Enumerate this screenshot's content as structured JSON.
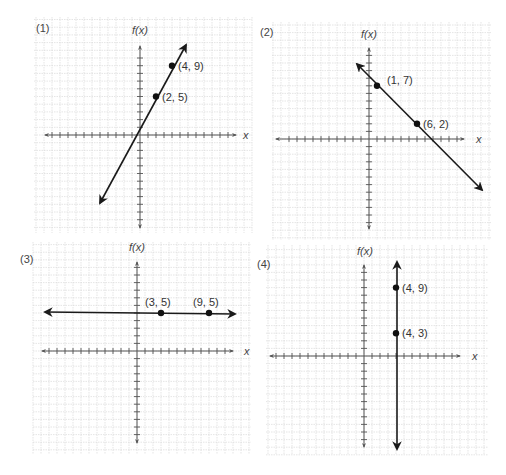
{
  "chart_data": [
    {
      "type": "line",
      "panel_label": "(1)",
      "ylabel": "f(x)",
      "xlabel": "x",
      "grid": true,
      "frame": {
        "x": 34,
        "y": 17,
        "w": 218,
        "h": 216
      },
      "origin": {
        "px": 140,
        "py": 135
      },
      "unit": {
        "x": 8,
        "y": 7.7
      },
      "xaxis": {
        "from": 45,
        "to": 236,
        "label_x": 243
      },
      "yaxis": {
        "from": 46,
        "to": 228,
        "label_y": 34
      },
      "label_pos": {
        "x": 36,
        "y": 32
      },
      "ylabel_pos": {
        "x": 132,
        "y": 34
      },
      "line": {
        "x1": 100,
        "y1": 203,
        "x2": 186,
        "y2": 45,
        "arrows": "both"
      },
      "points": [
        {
          "x": 2,
          "y": 5,
          "label": "(2, 5)"
        },
        {
          "x": 4,
          "y": 9,
          "label": "(4, 9)"
        }
      ],
      "description": "Increasing line through (2, 5) and (4, 9); slope 2"
    },
    {
      "type": "line",
      "panel_label": "(2)",
      "ylabel": "f(x)",
      "xlabel": "x",
      "grid": true,
      "frame": {
        "x": 272,
        "y": 22,
        "w": 220,
        "h": 218
      },
      "origin": {
        "px": 369,
        "py": 139
      },
      "unit": {
        "x": 8,
        "y": 7.6
      },
      "xaxis": {
        "from": 276,
        "to": 464,
        "label_x": 476
      },
      "yaxis": {
        "from": 48,
        "to": 229,
        "label_y": 38
      },
      "label_pos": {
        "x": 260,
        "y": 36
      },
      "ylabel_pos": {
        "x": 361,
        "y": 38
      },
      "line": {
        "x1": 357,
        "y1": 64,
        "x2": 482,
        "y2": 190,
        "arrows": "both"
      },
      "points": [
        {
          "x": 1,
          "y": 7,
          "label": "(1, 7)"
        },
        {
          "x": 6,
          "y": 2,
          "label": "(6, 2)"
        }
      ],
      "description": "Decreasing line through (1, 7) and (6, 2); slope -1"
    },
    {
      "type": "line",
      "panel_label": "(3)",
      "ylabel": "f(x)",
      "xlabel": "x",
      "grid": true,
      "frame": {
        "x": 33,
        "y": 242,
        "w": 218,
        "h": 212
      },
      "origin": {
        "px": 137,
        "py": 351
      },
      "unit": {
        "x": 8,
        "y": 7.6
      },
      "xaxis": {
        "from": 42,
        "to": 233,
        "label_x": 244
      },
      "yaxis": {
        "from": 262,
        "to": 443,
        "label_y": 251
      },
      "label_pos": {
        "x": 20,
        "y": 263
      },
      "ylabel_pos": {
        "x": 129,
        "y": 251
      },
      "line": {
        "x1": 45,
        "y1": 312,
        "x2": 235,
        "y2": 314,
        "arrows": "both"
      },
      "points": [
        {
          "x": 3,
          "y": 5,
          "label": "(3, 5)"
        },
        {
          "x": 9,
          "y": 5,
          "label": "(9, 5)"
        }
      ],
      "description": "Horizontal line f(x) = 5 through (3, 5) and (9, 5)"
    },
    {
      "type": "line",
      "panel_label": "(4)",
      "ylabel": "f(x)",
      "xlabel": "x",
      "grid": true,
      "frame": {
        "x": 266,
        "y": 245,
        "w": 222,
        "h": 210
      },
      "origin": {
        "px": 364,
        "py": 356
      },
      "unit": {
        "x": 8,
        "y": 7.6
      },
      "xaxis": {
        "from": 270,
        "to": 460,
        "label_x": 472
      },
      "yaxis": {
        "from": 265,
        "to": 447,
        "label_y": 255
      },
      "label_pos": {
        "x": 257,
        "y": 268
      },
      "ylabel_pos": {
        "x": 357,
        "y": 255
      },
      "line": {
        "x1": 397,
        "y1": 262,
        "x2": 397,
        "y2": 449,
        "arrows": "both"
      },
      "points": [
        {
          "x": 4,
          "y": 9,
          "label": "(4, 9)"
        },
        {
          "x": 4,
          "y": 3,
          "label": "(4, 3)"
        }
      ],
      "description": "Vertical line x = 4 through (4, 9) and (4, 3)"
    }
  ],
  "colors": {
    "grid": "#d4d4d4",
    "grid_major": "#c4c4c4",
    "axis": "#555555",
    "line": "#1a1a1a",
    "point": "#111111",
    "text": "#444444"
  }
}
